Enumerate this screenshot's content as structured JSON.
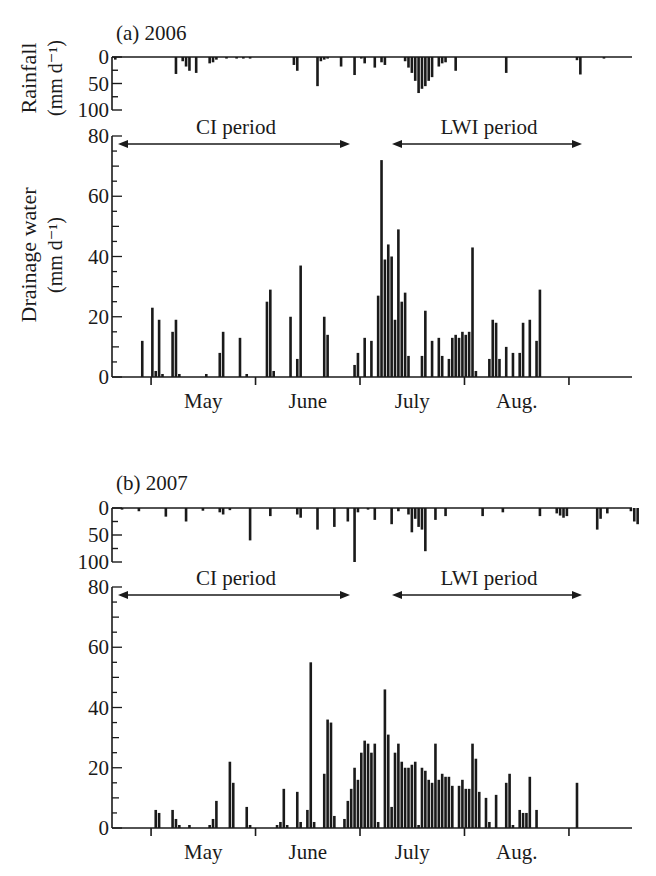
{
  "figure": {
    "panels": [
      {
        "label": "(a) 2006"
      },
      {
        "label": "(b) 2007"
      }
    ],
    "rain_ylabel_line1": "Rainfall",
    "rain_ylabel_line2": "(mm d⁻¹)",
    "drain_ylabel_line1": "Drainage water",
    "drain_ylabel_line2": "(mm d⁻¹)",
    "ci_label": "CI period",
    "lwi_label": "LWI period",
    "month_labels": [
      "May",
      "June",
      "July",
      "Aug."
    ],
    "rain_ticks": [
      "0",
      "50",
      "100"
    ],
    "drain_ticks": [
      "80",
      "60",
      "40",
      "20",
      "0"
    ],
    "bar_color": "#1a1a1a"
  },
  "chart_data": [
    {
      "type": "bar",
      "title": "(a) 2006",
      "subplot": "rainfall",
      "ylabel": "Rainfall (mm d-1)",
      "ylim": [
        100,
        0
      ],
      "inverted": true,
      "x_unit": "day index from axis start (~20 Apr); 1 day ≈ 3.37 px; month ticks at day 11 (1 May), 42 (1 Jun), 73 (1 Jul), 104 (1 Aug), 135 (1 Sep)",
      "xlabel_months": [
        "May",
        "June",
        "July",
        "Aug."
      ],
      "points": [
        [
          0,
          5
        ],
        [
          18,
          32
        ],
        [
          20,
          8
        ],
        [
          21,
          18
        ],
        [
          22,
          26
        ],
        [
          24,
          30
        ],
        [
          28,
          12
        ],
        [
          29,
          10
        ],
        [
          30,
          5
        ],
        [
          33,
          3
        ],
        [
          36,
          3
        ],
        [
          38,
          3
        ],
        [
          40,
          3
        ],
        [
          53,
          15
        ],
        [
          54,
          26
        ],
        [
          60,
          55
        ],
        [
          61,
          8
        ],
        [
          62,
          5
        ],
        [
          63,
          3
        ],
        [
          67,
          18
        ],
        [
          71,
          34
        ],
        [
          73,
          3
        ],
        [
          74,
          12
        ],
        [
          77,
          20
        ],
        [
          79,
          10
        ],
        [
          80,
          15
        ],
        [
          86,
          8
        ],
        [
          87,
          20
        ],
        [
          88,
          30
        ],
        [
          89,
          45
        ],
        [
          90,
          68
        ],
        [
          91,
          60
        ],
        [
          92,
          55
        ],
        [
          93,
          45
        ],
        [
          94,
          38
        ],
        [
          96,
          18
        ],
        [
          97,
          12
        ],
        [
          98,
          10
        ],
        [
          101,
          26
        ],
        [
          116,
          30
        ],
        [
          137,
          6
        ],
        [
          138,
          33
        ],
        [
          145,
          3
        ]
      ]
    },
    {
      "type": "bar",
      "title": "(a) 2006",
      "subplot": "drainage water",
      "ylabel": "Drainage water (mm d-1)",
      "ylim": [
        0,
        80
      ],
      "annotations": [
        {
          "text": "CI period",
          "from_day": 1,
          "to_day": 71
        },
        {
          "text": "LWI period",
          "from_day": 83,
          "to_day": 139
        }
      ],
      "points": [
        [
          8,
          12
        ],
        [
          11,
          23
        ],
        [
          12,
          2
        ],
        [
          13,
          19
        ],
        [
          14,
          1
        ],
        [
          17,
          15
        ],
        [
          18,
          19
        ],
        [
          19,
          1
        ],
        [
          27,
          1
        ],
        [
          31,
          8
        ],
        [
          32,
          15
        ],
        [
          37,
          13
        ],
        [
          39,
          1
        ],
        [
          45,
          25
        ],
        [
          46,
          29
        ],
        [
          47,
          2
        ],
        [
          52,
          20
        ],
        [
          54,
          6
        ],
        [
          55,
          37
        ],
        [
          62,
          20
        ],
        [
          63,
          14
        ],
        [
          71,
          4
        ],
        [
          72,
          8
        ],
        [
          74,
          13
        ],
        [
          76,
          12
        ],
        [
          78,
          27
        ],
        [
          79,
          72
        ],
        [
          80,
          39
        ],
        [
          81,
          44
        ],
        [
          82,
          40
        ],
        [
          83,
          19
        ],
        [
          84,
          49
        ],
        [
          85,
          25
        ],
        [
          86,
          28
        ],
        [
          87,
          7
        ],
        [
          91,
          7
        ],
        [
          92,
          22
        ],
        [
          94,
          12
        ],
        [
          96,
          13
        ],
        [
          97,
          7
        ],
        [
          99,
          6
        ],
        [
          100,
          13
        ],
        [
          101,
          14
        ],
        [
          102,
          13
        ],
        [
          103,
          15
        ],
        [
          104,
          14
        ],
        [
          105,
          15
        ],
        [
          106,
          43
        ],
        [
          107,
          2
        ],
        [
          111,
          6
        ],
        [
          112,
          19
        ],
        [
          113,
          18
        ],
        [
          114,
          6
        ],
        [
          116,
          10
        ],
        [
          118,
          8
        ],
        [
          120,
          8
        ],
        [
          121,
          18
        ],
        [
          123,
          19
        ],
        [
          125,
          12
        ],
        [
          126,
          29
        ]
      ]
    },
    {
      "type": "bar",
      "title": "(b) 2007",
      "subplot": "rainfall",
      "ylabel": "Rainfall (mm d-1)",
      "ylim": [
        100,
        0
      ],
      "inverted": true,
      "points": [
        [
          2,
          3
        ],
        [
          7,
          6
        ],
        [
          15,
          16
        ],
        [
          21,
          25
        ],
        [
          26,
          5
        ],
        [
          31,
          8
        ],
        [
          32,
          12
        ],
        [
          34,
          4
        ],
        [
          40,
          60
        ],
        [
          46,
          15
        ],
        [
          54,
          12
        ],
        [
          55,
          18
        ],
        [
          60,
          40
        ],
        [
          65,
          35
        ],
        [
          69,
          25
        ],
        [
          71,
          100
        ],
        [
          72,
          8
        ],
        [
          75,
          3
        ],
        [
          77,
          22
        ],
        [
          82,
          30
        ],
        [
          84,
          6
        ],
        [
          87,
          12
        ],
        [
          88,
          45
        ],
        [
          89,
          20
        ],
        [
          90,
          35
        ],
        [
          91,
          40
        ],
        [
          92,
          80
        ],
        [
          95,
          22
        ],
        [
          98,
          15
        ],
        [
          109,
          15
        ],
        [
          115,
          8
        ],
        [
          126,
          15
        ],
        [
          131,
          10
        ],
        [
          132,
          14
        ],
        [
          133,
          18
        ],
        [
          134,
          15
        ],
        [
          143,
          40
        ],
        [
          144,
          20
        ],
        [
          146,
          10
        ],
        [
          153,
          6
        ],
        [
          154,
          25
        ],
        [
          155,
          30
        ]
      ]
    },
    {
      "type": "bar",
      "title": "(b) 2007",
      "subplot": "drainage water",
      "ylabel": "Drainage water (mm d-1)",
      "ylim": [
        0,
        80
      ],
      "annotations": [
        {
          "text": "CI period",
          "from_day": 1,
          "to_day": 71
        },
        {
          "text": "LWI period",
          "from_day": 83,
          "to_day": 139
        }
      ],
      "points": [
        [
          12,
          6
        ],
        [
          13,
          5
        ],
        [
          17,
          6
        ],
        [
          18,
          3
        ],
        [
          19,
          1
        ],
        [
          22,
          1
        ],
        [
          28,
          1
        ],
        [
          29,
          3
        ],
        [
          30,
          9
        ],
        [
          34,
          22
        ],
        [
          35,
          15
        ],
        [
          39,
          7
        ],
        [
          40,
          1
        ],
        [
          48,
          1
        ],
        [
          49,
          2
        ],
        [
          50,
          13
        ],
        [
          51,
          1
        ],
        [
          54,
          12
        ],
        [
          55,
          2
        ],
        [
          57,
          6
        ],
        [
          58,
          55
        ],
        [
          59,
          2
        ],
        [
          62,
          18
        ],
        [
          63,
          36
        ],
        [
          64,
          35
        ],
        [
          65,
          4
        ],
        [
          68,
          3
        ],
        [
          69,
          9
        ],
        [
          70,
          13
        ],
        [
          71,
          20
        ],
        [
          72,
          16
        ],
        [
          73,
          25
        ],
        [
          74,
          29
        ],
        [
          75,
          28
        ],
        [
          76,
          25
        ],
        [
          77,
          28
        ],
        [
          78,
          2
        ],
        [
          80,
          46
        ],
        [
          81,
          31
        ],
        [
          82,
          7
        ],
        [
          83,
          25
        ],
        [
          84,
          28
        ],
        [
          85,
          22
        ],
        [
          86,
          20
        ],
        [
          87,
          20
        ],
        [
          88,
          21
        ],
        [
          89,
          22
        ],
        [
          90,
          1
        ],
        [
          91,
          20
        ],
        [
          92,
          19
        ],
        [
          93,
          16
        ],
        [
          94,
          15
        ],
        [
          95,
          28
        ],
        [
          96,
          16
        ],
        [
          97,
          18
        ],
        [
          98,
          17
        ],
        [
          99,
          17
        ],
        [
          100,
          14
        ],
        [
          102,
          14
        ],
        [
          103,
          16
        ],
        [
          104,
          13
        ],
        [
          105,
          13
        ],
        [
          106,
          28
        ],
        [
          107,
          23
        ],
        [
          108,
          12
        ],
        [
          110,
          10
        ],
        [
          111,
          2
        ],
        [
          113,
          11
        ],
        [
          116,
          15
        ],
        [
          117,
          18
        ],
        [
          118,
          1
        ],
        [
          120,
          6
        ],
        [
          121,
          5
        ],
        [
          122,
          5
        ],
        [
          123,
          17
        ],
        [
          125,
          6
        ],
        [
          137,
          15
        ]
      ]
    }
  ]
}
